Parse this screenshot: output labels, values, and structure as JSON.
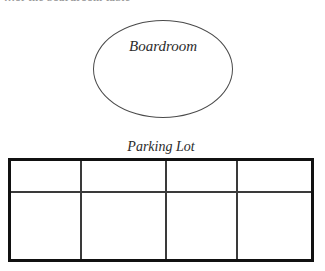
{
  "page": {
    "background_color": "#ffffff",
    "header_text": "…of the boardroom table"
  },
  "diagram": {
    "ellipse": {
      "label": "Boardroom",
      "stroke_color": "#4a4a4a"
    },
    "parking_lot": {
      "caption": "Parking Lot",
      "border_color": "#111111",
      "divider_color": "#3a3a3a",
      "rows": [
        {
          "cells": [
            "",
            "",
            "",
            ""
          ]
        },
        {
          "cells": [
            "",
            "",
            "",
            ""
          ]
        }
      ]
    }
  }
}
